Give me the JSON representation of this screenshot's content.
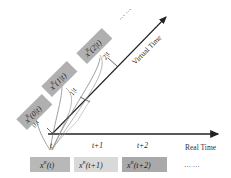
{
  "axes": {
    "real_time_label": "Real Time",
    "virtual_time_label": "Virtual Time"
  },
  "real_ticks": [
    {
      "label": "t",
      "x": 52
    },
    {
      "label": "t+1",
      "x": 99
    },
    {
      "label": "t+2",
      "x": 145
    }
  ],
  "real_boxes": [
    {
      "base": "x",
      "sup": "R",
      "arg": "(t)",
      "color": "#b8b8b8"
    },
    {
      "base": "x",
      "sup": "R",
      "arg": "(t+1)",
      "color": "#d9d9d9"
    },
    {
      "base": "x",
      "sup": "R",
      "arg": "(t+2)",
      "color": "#a9a9a9"
    },
    {
      "text": "…  …"
    }
  ],
  "virtual_boxes": [
    {
      "base": "x",
      "sup": "R",
      "arg": "(0|t)",
      "color": "#b0b0b0"
    },
    {
      "base": "x",
      "sup": "R",
      "arg": "(1|t)",
      "color": "#b0b0b0"
    },
    {
      "base": "x",
      "sup": "R",
      "arg": "(2|t)",
      "color": "#b0b0b0"
    },
    {
      "text": "…  …"
    }
  ],
  "virtual_ticks": [
    "0|t",
    "1|t",
    "2|t"
  ]
}
